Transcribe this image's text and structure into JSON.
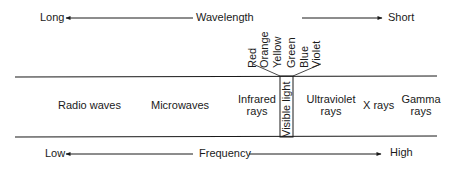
{
  "wavelength_axis": {
    "label": "Wavelength",
    "left_end": "Long",
    "right_end": "Short"
  },
  "frequency_axis": {
    "label": "Frequency",
    "left_end": "Low",
    "right_end": "High"
  },
  "spectrum_regions": [
    {
      "line1": "Radio waves",
      "line2": ""
    },
    {
      "line1": "Microwaves",
      "line2": ""
    },
    {
      "line1": "Infrared",
      "line2": "rays"
    },
    {
      "line1": "Visible light",
      "line2": ""
    },
    {
      "line1": "Ultraviolet",
      "line2": "rays"
    },
    {
      "line1": "X rays",
      "line2": ""
    },
    {
      "line1": "Gamma",
      "line2": "rays"
    }
  ],
  "visible_colors": [
    "Red",
    "Orange",
    "Yellow",
    "Green",
    "Blue",
    "Violet"
  ]
}
